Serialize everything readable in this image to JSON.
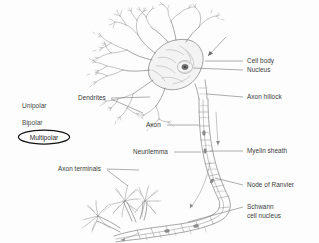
{
  "figure": {
    "type": "biological-diagram",
    "background_color": "#fdfdfd",
    "ink_color": "#6e6e6e",
    "label_color": "#3b3b3b",
    "highlight_color": "#111111"
  },
  "polarity_list": {
    "items": [
      {
        "label": "Unipolar",
        "selected": false
      },
      {
        "label": "Bipolar",
        "selected": false
      },
      {
        "label": "Multipolar",
        "selected": true
      }
    ]
  },
  "callouts": {
    "left": [
      {
        "id": "dendrites",
        "label": "Dendrites"
      },
      {
        "id": "axon",
        "label": "Axon"
      },
      {
        "id": "neurilemma",
        "label": "Neurilemma"
      },
      {
        "id": "axon-terminals",
        "label": "Axon terminals"
      }
    ],
    "right": [
      {
        "id": "cell-body",
        "label": "Cell body"
      },
      {
        "id": "nucleus",
        "label": "Nucleus"
      },
      {
        "id": "axon-hillock",
        "label": "Axon hillock"
      },
      {
        "id": "myelin-sheath",
        "label": "Myelin sheath"
      },
      {
        "id": "node-of-ranvier",
        "label": "Node of Ranvier"
      },
      {
        "id": "schwann-cell-nucleus-line1",
        "label": "Schwann"
      },
      {
        "id": "schwann-cell-nucleus-line2",
        "label": "cell nucleus"
      }
    ]
  }
}
